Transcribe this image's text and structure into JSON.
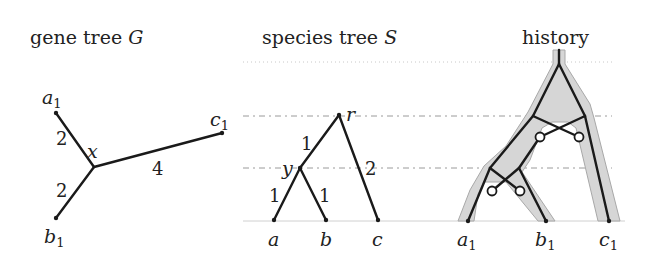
{
  "panels": {
    "gene_tree": {
      "title": "gene tree ",
      "title_symbol": "G",
      "nodes": {
        "a1": {
          "label": "a",
          "sub": "1"
        },
        "b1": {
          "label": "b",
          "sub": "1"
        },
        "c1": {
          "label": "c",
          "sub": "1"
        },
        "x": {
          "label": "x"
        }
      },
      "edge_lengths": {
        "x_a1": "2",
        "x_b1": "2",
        "x_c1": "4"
      }
    },
    "species_tree": {
      "title": "species tree ",
      "title_symbol": "S",
      "nodes": {
        "r": {
          "label": "r"
        },
        "y": {
          "label": "y"
        },
        "a": {
          "label": "a"
        },
        "b": {
          "label": "b"
        },
        "c": {
          "label": "c"
        }
      },
      "edge_lengths": {
        "r_y": "1",
        "r_c": "2",
        "y_a": "1",
        "y_b": "1"
      }
    },
    "history": {
      "title": "history",
      "leaves": {
        "a1": {
          "label": "a",
          "sub": "1"
        },
        "b1": {
          "label": "b",
          "sub": "1"
        },
        "c1": {
          "label": "c",
          "sub": "1"
        }
      },
      "loss_markers": 4
    }
  },
  "colors": {
    "edge": "#1a1a1a",
    "band_fill": "#d6d6d6",
    "band_stroke": "#a8a8a8",
    "guide": "#9a9a9a"
  }
}
